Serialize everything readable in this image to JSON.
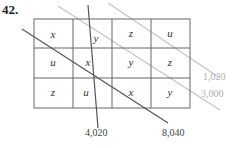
{
  "problem_number": "42.",
  "grid": {
    "rows": [
      [
        "x",
        "y",
        "z",
        "u"
      ],
      [
        "u",
        "x",
        "y",
        "z"
      ],
      [
        "z",
        "u",
        "x",
        "y"
      ]
    ]
  },
  "lines": [
    {
      "label": "1,020",
      "color": "#b8b8b8"
    },
    {
      "label": "3,000",
      "color": "#b8b8b8"
    },
    {
      "label": "4,020",
      "color": "#555555"
    },
    {
      "label": "8,040",
      "color": "#555555"
    }
  ]
}
